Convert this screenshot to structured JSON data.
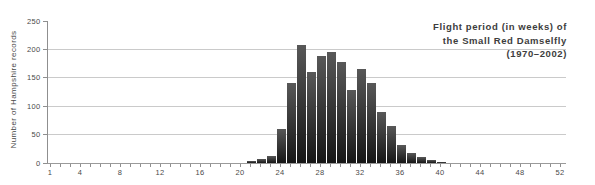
{
  "title": {
    "lines": [
      "Flight period (in weeks) of",
      "the Small Red Damselfly",
      "(1970–2002)"
    ]
  },
  "chart_data": {
    "type": "bar",
    "title": "Flight period (in weeks) of the Small Red Damselfly (1970–2002)",
    "xlabel": "",
    "ylabel": "Number of Hampshire records",
    "x": [
      21,
      22,
      23,
      24,
      25,
      26,
      27,
      28,
      29,
      30,
      31,
      32,
      33,
      34,
      35,
      36,
      37,
      38,
      39,
      40
    ],
    "values": [
      4,
      7,
      13,
      60,
      140,
      207,
      160,
      188,
      196,
      177,
      129,
      166,
      140,
      90,
      65,
      31,
      17,
      10,
      6,
      2
    ],
    "xlim": [
      0,
      53
    ],
    "ylim": [
      0,
      250
    ],
    "x_tick_step": 1,
    "x_tick_labels": [
      1,
      4,
      8,
      12,
      16,
      20,
      24,
      28,
      32,
      36,
      40,
      44,
      48,
      52
    ],
    "y_tick_labels": [
      0,
      50,
      100,
      150,
      200,
      250
    ],
    "grid": "horizontal",
    "legend": "none",
    "colors": {
      "bar_top": "#585858",
      "bar_bottom": "#161616",
      "grid": "#cacaca",
      "axis": "#9a9a9a",
      "text": "#4a4a4a",
      "title_text": "#3d3d3d",
      "background": "#ffffff"
    }
  }
}
